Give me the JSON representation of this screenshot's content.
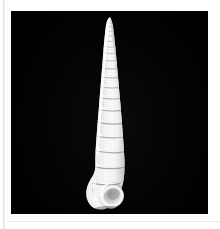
{
  "page": {
    "background_color": "#ffffff",
    "rule_color": "#e2e2e2",
    "divider_color": "#ececec"
  },
  "figure": {
    "name": "shell-specimen-photograph",
    "background_color": "#000000",
    "orientation": "apex up, aperture lower right",
    "plate_bounds": {
      "x": 11,
      "y": 11,
      "width": 197,
      "height": 203
    },
    "caption": ""
  },
  "specimen": {
    "label": "",
    "shell_color": "#ffffff",
    "shadow_color": "#b9b9b9",
    "whorl_count": 14,
    "bounds": {
      "x": 83,
      "y": 18,
      "width": 48,
      "height": 193
    },
    "apex": {
      "x": 113,
      "y": 18
    },
    "aperture": {
      "x": 112,
      "y": 194
    },
    "texture": "beaded axial ribs with spiral cords"
  }
}
